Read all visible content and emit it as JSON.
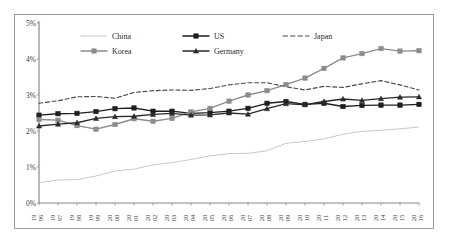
{
  "chart_data": {
    "type": "line",
    "title": "",
    "subtitle": "",
    "xlabel": "",
    "ylabel": "",
    "ylim": [
      0,
      5
    ],
    "yticks": [
      "0%",
      "1%",
      "2%",
      "3%",
      "4%",
      "5%"
    ],
    "ytick_values": [
      0,
      1,
      2,
      3,
      4,
      5
    ],
    "grid": false,
    "legend_position": "top-center",
    "x": [
      "1996",
      "1997",
      "1998",
      "1999",
      "2000",
      "2001",
      "2002",
      "2003",
      "2004",
      "2005",
      "2006",
      "2007",
      "2008",
      "2009",
      "2010",
      "2011",
      "2012",
      "2013",
      "2014",
      "2015",
      "2016"
    ],
    "categories": [
      "1996",
      "1997",
      "1998",
      "1999",
      "2000",
      "2001",
      "2002",
      "2003",
      "2004",
      "2005",
      "2006",
      "2007",
      "2008",
      "2009",
      "2010",
      "2011",
      "2012",
      "2013",
      "2014",
      "2015",
      "2016"
    ],
    "series": [
      {
        "name": "China",
        "color": "#c9c9c9",
        "marker": "none",
        "dash": "solid",
        "values": [
          0.56,
          0.64,
          0.65,
          0.75,
          0.89,
          0.94,
          1.06,
          1.12,
          1.21,
          1.31,
          1.37,
          1.38,
          1.45,
          1.66,
          1.71,
          1.78,
          1.91,
          1.99,
          2.02,
          2.06,
          2.11
        ]
      },
      {
        "name": "US",
        "color": "#1f1f1f",
        "marker": "square",
        "dash": "solid",
        "values": [
          2.44,
          2.48,
          2.49,
          2.54,
          2.62,
          2.64,
          2.55,
          2.55,
          2.49,
          2.51,
          2.55,
          2.63,
          2.77,
          2.82,
          2.74,
          2.77,
          2.68,
          2.71,
          2.72,
          2.72,
          2.74
        ]
      },
      {
        "name": "Japan",
        "color": "#4a4a4a",
        "marker": "none",
        "dash": "dashed",
        "values": [
          2.77,
          2.84,
          2.95,
          2.96,
          2.91,
          3.07,
          3.12,
          3.14,
          3.13,
          3.18,
          3.28,
          3.34,
          3.34,
          3.23,
          3.14,
          3.24,
          3.21,
          3.31,
          3.4,
          3.28,
          3.14
        ]
      },
      {
        "name": "Korea",
        "color": "#8c8c8c",
        "marker": "square",
        "dash": "solid",
        "values": [
          2.32,
          2.3,
          2.15,
          2.05,
          2.18,
          2.34,
          2.27,
          2.35,
          2.53,
          2.63,
          2.83,
          3.0,
          3.12,
          3.29,
          3.47,
          3.74,
          4.03,
          4.15,
          4.29,
          4.22,
          4.23
        ]
      },
      {
        "name": "Germany",
        "color": "#2a2a2a",
        "marker": "triangle",
        "dash": "solid",
        "values": [
          2.14,
          2.19,
          2.23,
          2.35,
          2.4,
          2.41,
          2.46,
          2.49,
          2.44,
          2.45,
          2.5,
          2.47,
          2.62,
          2.76,
          2.73,
          2.82,
          2.89,
          2.85,
          2.9,
          2.94,
          2.95
        ]
      }
    ]
  },
  "legend": {
    "items": [
      {
        "label": "China"
      },
      {
        "label": "US"
      },
      {
        "label": "Japan"
      },
      {
        "label": "Korea"
      },
      {
        "label": "Germany"
      }
    ]
  },
  "axis": {
    "y_tick_labels": [
      "5%",
      "4%",
      "3%",
      "2%",
      "1%",
      "0%"
    ],
    "x_tick_labels": [
      "1996",
      "1997",
      "1998",
      "1999",
      "2000",
      "2001",
      "2002",
      "2003",
      "2004",
      "2005",
      "2006",
      "2007",
      "2008",
      "2009",
      "2010",
      "2011",
      "2012",
      "2013",
      "2014",
      "2015",
      "2016"
    ]
  }
}
